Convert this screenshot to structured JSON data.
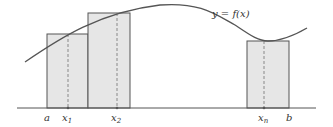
{
  "diagram": {
    "type": "riemann-sum",
    "curve_label": "y = f(x)",
    "axis_labels": {
      "a": "a",
      "b": "b",
      "x1": "x",
      "x1_sub": "1",
      "x2": "x",
      "x2_sub": "2",
      "xn": "x",
      "xn_sub": "n"
    },
    "colors": {
      "rect_fill": "#e6e6e6",
      "stroke": "#555555",
      "dashed": "#888888"
    }
  }
}
